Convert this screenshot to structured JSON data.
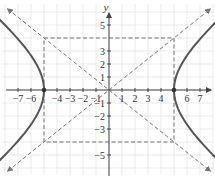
{
  "chart_data": {
    "type": "line",
    "title": "",
    "equation": "x^2/25 - y^2/16 = 1",
    "xlabel": "",
    "ylabel": "y",
    "xlim": [
      -8.4,
      8.1
    ],
    "ylim": [
      -6.8,
      6.9
    ],
    "grid": true,
    "x_ticks": [
      -7,
      -6,
      -4,
      -3,
      -2,
      -1,
      1,
      2,
      3,
      4,
      6,
      7
    ],
    "x_tick_labels": [
      "−7",
      "−6",
      "−4",
      "−3",
      "−2",
      "−1",
      "1",
      "2",
      "3",
      "4",
      "6",
      "7"
    ],
    "y_ticks": [
      5,
      3,
      2,
      1,
      -1,
      -2,
      -3,
      -5
    ],
    "y_tick_labels": [
      "5",
      "3",
      "2",
      "1",
      "−1",
      "−2",
      "−3",
      "−5"
    ],
    "vertices": [
      [
        -5,
        0
      ],
      [
        5,
        0
      ]
    ],
    "central_rectangle": {
      "x": [
        -5,
        5
      ],
      "y": [
        -4,
        4
      ]
    },
    "asymptotes": [
      {
        "name": "y = 4/5 x",
        "slope": 0.8
      },
      {
        "name": "y = -4/5 x",
        "slope": -0.8
      }
    ],
    "series": [
      {
        "name": "right branch",
        "a": 5,
        "b": 4,
        "branch": "right"
      },
      {
        "name": "left branch",
        "a": 5,
        "b": 4,
        "branch": "left"
      }
    ]
  },
  "colors": {
    "curve": "#555555",
    "axis": "#444444",
    "grid": "#e2e2e2",
    "dashed": "#777777"
  }
}
